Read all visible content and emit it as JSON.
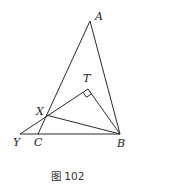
{
  "figure": {
    "caption": "图 102",
    "points": {
      "A": {
        "label": "A",
        "x": 90,
        "y": 21,
        "lx": 95,
        "ly": 20
      },
      "T": {
        "label": "T",
        "x": 88,
        "y": 89,
        "lx": 83,
        "ly": 82
      },
      "X": {
        "label": "X",
        "x": 46,
        "y": 115,
        "lx": 36,
        "ly": 115
      },
      "Y": {
        "label": "Y",
        "x": 20,
        "y": 134,
        "lx": 13,
        "ly": 146
      },
      "C": {
        "label": "C",
        "x": 38,
        "y": 134,
        "lx": 34,
        "ly": 146
      },
      "B": {
        "label": "B",
        "x": 120,
        "y": 134,
        "lx": 117,
        "ly": 147
      }
    },
    "segments": [
      [
        "A",
        "B"
      ],
      [
        "A",
        "C"
      ],
      [
        "Y",
        "T"
      ],
      [
        "T",
        "B"
      ],
      [
        "X",
        "B"
      ],
      [
        "Y",
        "B"
      ]
    ],
    "right_angle_at": "T"
  }
}
